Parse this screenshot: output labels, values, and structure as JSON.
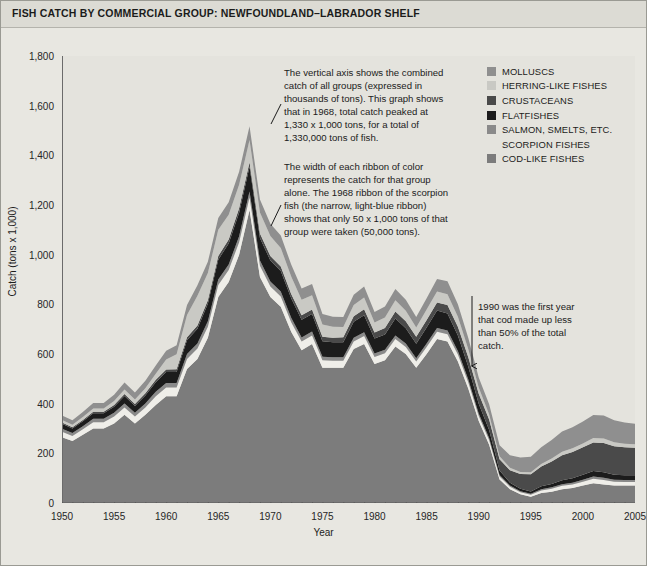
{
  "header": {
    "title": "FISH CATCH BY COMMERCIAL GROUP: NEWFOUNDLAND–LABRADOR SHELF"
  },
  "legend": {
    "position": "top-right",
    "items": [
      {
        "label": "MOLLUSCS",
        "color": "#8f8f8f",
        "swatch": true
      },
      {
        "label": "HERRING-LIKE FISHES",
        "color": "#c9c9c4",
        "swatch": true
      },
      {
        "label": "CRUSTACEANS",
        "color": "#4a4a4a",
        "swatch": true
      },
      {
        "label": "FLATFISHES",
        "color": "#1c1c1c",
        "swatch": true
      },
      {
        "label": "SALMON, SMELTS, ETC.",
        "color": "#8a8a8a",
        "swatch": true
      },
      {
        "label": "SCORPION FISHES",
        "color": "#efeee9",
        "swatch": false
      },
      {
        "label": "COD-LIKE FISHES",
        "color": "#7c7c7c",
        "swatch": true
      }
    ]
  },
  "annotations": [
    {
      "name": "annotation-vertical-axis",
      "text": "The vertical axis shows the combined catch of all groups (expressed in thousands of tons). This graph shows that in 1968, total catch peaked at 1,330 x 1,000 tons, for a total of 1,330,000 tons of fish."
    },
    {
      "name": "annotation-ribbon-width",
      "text": "The width of each ribbon of color represents the catch for that group alone. The 1968 ribbon of the scorpion fish (the narrow, light-blue ribbon) shows that only 50 x 1,000 tons of that group were taken (50,000 tons)."
    },
    {
      "name": "annotation-1990-cod",
      "text": "1990 was the first year that cod made up less than 50% of the total catch."
    }
  ],
  "chart_data": {
    "type": "area",
    "title": "FISH CATCH BY COMMERCIAL GROUP: NEWFOUNDLAND–LABRADOR SHELF",
    "xlabel": "Year",
    "ylabel": "Catch (tons x 1,000)",
    "xlim": [
      1950,
      2005
    ],
    "ylim": [
      0,
      1800
    ],
    "ytick_values": [
      0,
      200,
      400,
      600,
      800,
      1000,
      1200,
      1400,
      1600,
      1800
    ],
    "ytick_labels": [
      "0",
      "200",
      "400",
      "600",
      "800",
      "1,000",
      "1,200",
      "1,400",
      "1,600",
      "1,800"
    ],
    "xtick_values": [
      1950,
      1955,
      1960,
      1965,
      1970,
      1975,
      1980,
      1985,
      1990,
      1995,
      2000,
      2005
    ],
    "xtick_labels": [
      "1950",
      "1955",
      "1960",
      "1965",
      "1970",
      "1975",
      "1980",
      "1985",
      "1990",
      "1995",
      "2000",
      "2005"
    ],
    "x_minor_tick_step": 1,
    "grid": false,
    "stacked": true,
    "stack_order_bottom_to_top": [
      "COD-LIKE FISHES",
      "SCORPION FISHES",
      "SALMON, SMELTS, ETC.",
      "FLATFISHES",
      "CRUSTACEANS",
      "HERRING-LIKE FISHES",
      "MOLLUSCS"
    ],
    "x": [
      1950,
      1951,
      1952,
      1953,
      1954,
      1955,
      1956,
      1957,
      1958,
      1959,
      1960,
      1961,
      1962,
      1963,
      1964,
      1965,
      1966,
      1967,
      1968,
      1969,
      1970,
      1971,
      1972,
      1973,
      1974,
      1975,
      1976,
      1977,
      1978,
      1979,
      1980,
      1981,
      1982,
      1983,
      1984,
      1985,
      1986,
      1987,
      1988,
      1989,
      1990,
      1991,
      1992,
      1993,
      1994,
      1995,
      1996,
      1997,
      1998,
      1999,
      2000,
      2001,
      2002,
      2003,
      2004,
      2005
    ],
    "series": [
      {
        "name": "COD-LIKE FISHES",
        "color": "#7c7c7c",
        "values": [
          265,
          250,
          275,
          300,
          300,
          320,
          355,
          320,
          355,
          395,
          430,
          430,
          540,
          580,
          665,
          830,
          890,
          1000,
          1180,
          910,
          830,
          790,
          690,
          615,
          640,
          545,
          545,
          545,
          620,
          640,
          560,
          575,
          630,
          600,
          545,
          600,
          660,
          650,
          570,
          460,
          330,
          235,
          95,
          55,
          35,
          25,
          40,
          45,
          55,
          60,
          70,
          80,
          75,
          70,
          70,
          70
        ]
      },
      {
        "name": "SCORPION FISHES",
        "color": "#efeee9",
        "values": [
          22,
          20,
          22,
          25,
          25,
          28,
          30,
          28,
          30,
          35,
          35,
          35,
          40,
          42,
          45,
          48,
          48,
          50,
          50,
          45,
          42,
          42,
          38,
          35,
          35,
          30,
          28,
          28,
          30,
          32,
          28,
          28,
          30,
          28,
          25,
          28,
          30,
          30,
          28,
          25,
          20,
          18,
          12,
          10,
          8,
          8,
          10,
          12,
          14,
          15,
          16,
          18,
          18,
          16,
          15,
          15
        ]
      },
      {
        "name": "SALMON, SMELTS, ETC.",
        "color": "#8a8a8a",
        "values": [
          12,
          12,
          12,
          14,
          14,
          15,
          16,
          15,
          16,
          18,
          18,
          18,
          20,
          20,
          22,
          22,
          22,
          24,
          24,
          22,
          20,
          20,
          18,
          16,
          16,
          14,
          14,
          14,
          15,
          16,
          14,
          14,
          15,
          14,
          13,
          14,
          15,
          15,
          14,
          12,
          10,
          9,
          6,
          5,
          4,
          4,
          5,
          6,
          7,
          7,
          8,
          9,
          9,
          8,
          8,
          8
        ]
      },
      {
        "name": "FLATFISHES",
        "color": "#1c1c1c",
        "values": [
          20,
          18,
          20,
          22,
          22,
          25,
          30,
          28,
          32,
          38,
          45,
          45,
          55,
          60,
          70,
          80,
          85,
          95,
          100,
          90,
          85,
          82,
          78,
          72,
          70,
          62,
          60,
          60,
          65,
          68,
          60,
          62,
          68,
          62,
          58,
          65,
          70,
          68,
          62,
          52,
          40,
          32,
          18,
          12,
          10,
          9,
          12,
          14,
          16,
          18,
          20,
          22,
          22,
          20,
          19,
          19
        ]
      },
      {
        "name": "CRUSTACEANS",
        "color": "#4a4a4a",
        "values": [
          5,
          5,
          5,
          6,
          6,
          7,
          8,
          8,
          9,
          10,
          10,
          11,
          12,
          13,
          14,
          15,
          16,
          18,
          18,
          18,
          18,
          18,
          18,
          18,
          18,
          18,
          18,
          20,
          22,
          24,
          25,
          26,
          28,
          28,
          28,
          30,
          32,
          34,
          36,
          38,
          40,
          42,
          45,
          50,
          60,
          70,
          80,
          90,
          100,
          105,
          110,
          115,
          118,
          115,
          112,
          110
        ]
      },
      {
        "name": "HERRING-LIKE FISHES",
        "color": "#c9c9c4",
        "values": [
          10,
          10,
          12,
          14,
          14,
          16,
          18,
          18,
          20,
          24,
          40,
          60,
          90,
          120,
          110,
          105,
          100,
          95,
          90,
          85,
          80,
          75,
          70,
          62,
          58,
          50,
          45,
          42,
          45,
          48,
          40,
          42,
          45,
          42,
          38,
          42,
          45,
          44,
          40,
          32,
          25,
          20,
          12,
          10,
          8,
          8,
          10,
          12,
          14,
          15,
          16,
          18,
          18,
          16,
          15,
          15
        ]
      },
      {
        "name": "MOLLUSCS",
        "color": "#8f8f8f",
        "values": [
          18,
          18,
          20,
          22,
          22,
          25,
          28,
          28,
          30,
          34,
          35,
          36,
          40,
          42,
          45,
          48,
          50,
          52,
          55,
          52,
          50,
          50,
          48,
          46,
          45,
          42,
          40,
          40,
          42,
          44,
          42,
          44,
          46,
          44,
          42,
          46,
          50,
          52,
          50,
          45,
          40,
          42,
          45,
          50,
          58,
          62,
          68,
          75,
          82,
          85,
          88,
          92,
          92,
          88,
          85,
          82
        ]
      }
    ],
    "annotated_points": [
      {
        "year": 1968,
        "label": "total catch peak",
        "total": 1330
      },
      {
        "year": 1968,
        "label": "scorpion fishes ribbon",
        "value": 50
      },
      {
        "year": 1990,
        "label": "first year cod < 50% of total catch"
      }
    ]
  }
}
